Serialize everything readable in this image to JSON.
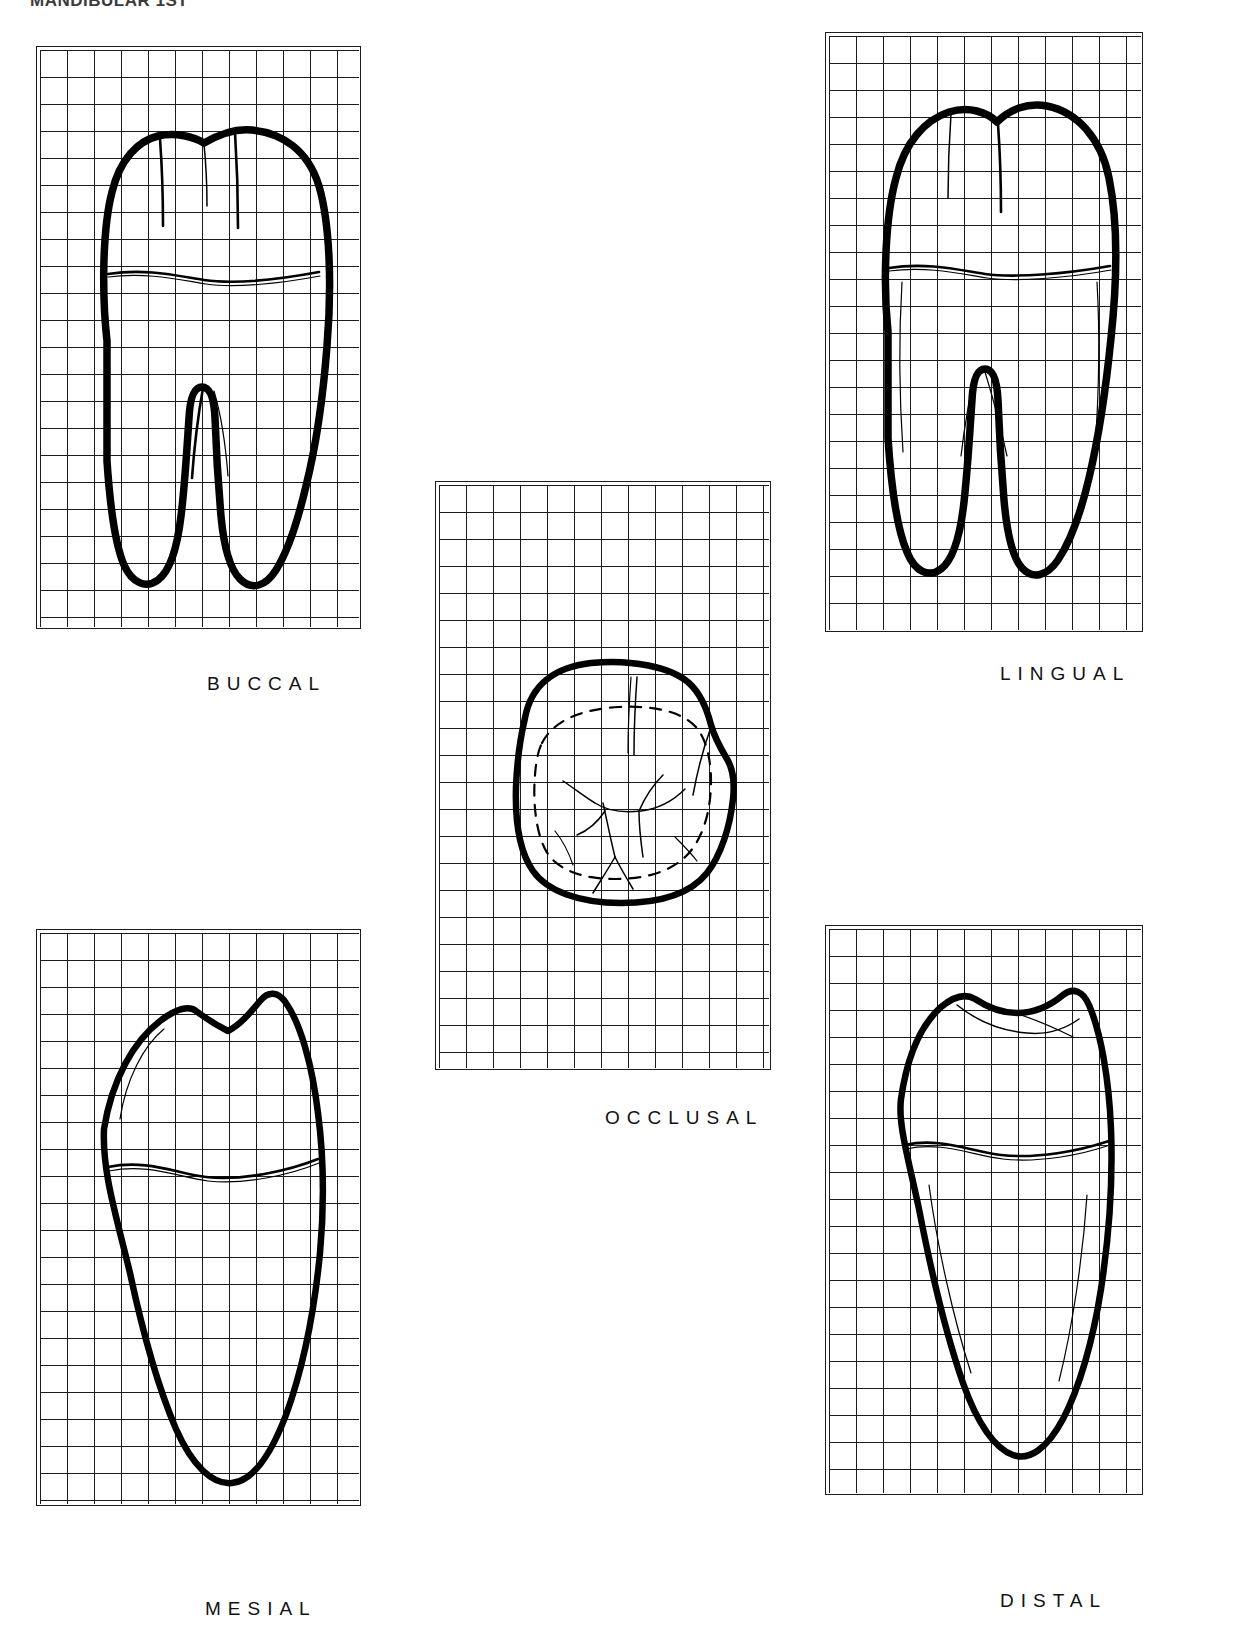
{
  "header": {
    "caption": "MANDIBULAR 1ST"
  },
  "plate": {
    "title": "Mandibular first molar — five anatomical views on grid",
    "ink_color": "#000000",
    "grid_line_color": "#1c1c1c",
    "background_color": "#ffffff",
    "grid_cell_px": 27
  },
  "views": [
    {
      "id": "buccal",
      "label": "BUCCAL",
      "label_x": 207,
      "label_y": 673,
      "panel": {
        "x": 36,
        "y": 46,
        "w": 325,
        "h": 583
      },
      "grid": {
        "cols": 12,
        "rows": 21
      },
      "description": "Crown with four cusps, cervical line, two roots (mesial and distal) with furcation"
    },
    {
      "id": "lingual",
      "label": "LINGUAL",
      "label_x": 1000,
      "label_y": 663,
      "panel": {
        "x": 825,
        "y": 32,
        "w": 318,
        "h": 600
      },
      "grid": {
        "cols": 12,
        "rows": 22
      },
      "description": "Lingual aspect of crown with two lingual cusps, cervical line and two roots"
    },
    {
      "id": "occlusal",
      "label": "OCCLUSAL",
      "label_x": 605,
      "label_y": 1107,
      "panel": {
        "x": 435,
        "y": 481,
        "w": 336,
        "h": 589
      },
      "grid": {
        "cols": 12,
        "rows": 21
      },
      "description": "Occlusal table with dashed cervical ridge outline, central groove, mesiobuccal, distobuccal and distal developmental grooves"
    },
    {
      "id": "mesial",
      "label": "MESIAL",
      "label_x": 205,
      "label_y": 1598,
      "panel": {
        "x": 36,
        "y": 929,
        "w": 325,
        "h": 577
      },
      "grid": {
        "cols": 12,
        "rows": 21
      },
      "description": "Mesial aspect: buccal and lingual cusps with tapering fused mesial root"
    },
    {
      "id": "distal",
      "label": "DISTAL",
      "label_x": 1000,
      "label_y": 1590,
      "panel": {
        "x": 825,
        "y": 925,
        "w": 318,
        "h": 570
      },
      "grid": {
        "cols": 12,
        "rows": 21
      },
      "description": "Distal aspect: distal cusp ridge, cervical line and distal root"
    }
  ],
  "chart_data": {
    "type": "table",
    "categories": [
      "BUCCAL",
      "LINGUAL",
      "OCCLUSAL",
      "MESIAL",
      "DISTAL"
    ],
    "values": [
      1,
      1,
      1,
      1,
      1
    ],
    "xlabel": "",
    "ylabel": ""
  }
}
